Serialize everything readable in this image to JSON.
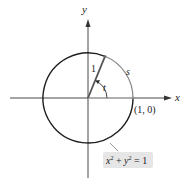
{
  "diagram": {
    "axes": {
      "x_label": "x",
      "y_label": "y"
    },
    "labels": {
      "radius": "1",
      "arc": "s",
      "angle": "t",
      "point": "(1, 0)",
      "equation_lhs_x": "x",
      "equation_exp1": "2",
      "equation_plus": " + ",
      "equation_y": "y",
      "equation_exp2": "2",
      "equation_rhs": " = 1"
    },
    "colors": {
      "circle": "#1e1e1e",
      "arc_highlight": "#8a8a8a",
      "radius_segment": "#8a8a8a",
      "axes": "#333333",
      "label_box": "#e6e6e6"
    }
  }
}
